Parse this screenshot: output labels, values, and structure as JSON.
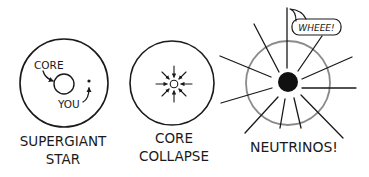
{
  "comic": {
    "panels": [
      {
        "id": "supergiant",
        "caption_lines": [
          "SUPERGIANT",
          "STAR"
        ],
        "annotations": {
          "core": "CORE",
          "you": "YOU"
        }
      },
      {
        "id": "core-collapse",
        "caption_lines": [
          "CORE",
          "COLLAPSE"
        ]
      },
      {
        "id": "neutrinos",
        "caption_lines": [
          "NEUTRINOS!"
        ],
        "speech_bubble": "WHEEE!"
      }
    ]
  },
  "colors": {
    "ink": "#1a1a1a",
    "star_outline_gray": "#8a8a8a",
    "background": "#ffffff"
  }
}
